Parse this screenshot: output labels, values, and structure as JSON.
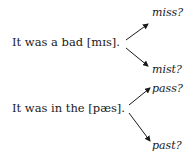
{
  "diagram": {
    "examples": [
      {
        "sentence": "It was a bad [mɪs].",
        "options": [
          "miss?",
          "mist?"
        ]
      },
      {
        "sentence": "It was in the [pæs].",
        "options": [
          "pass?",
          "past?"
        ]
      }
    ]
  }
}
